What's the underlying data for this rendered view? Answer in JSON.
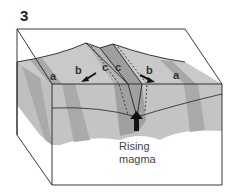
{
  "figure": {
    "number": "3",
    "labels": {
      "a_left": "a",
      "b_left": "b",
      "c_left": "c",
      "c_right": "c",
      "b_right": "b",
      "a_right": "a"
    },
    "caption_line1": "Rising",
    "caption_line2": "magma"
  },
  "colors": {
    "light_band": "#c8c8c8",
    "mid_band": "#b0b0b0",
    "dark_band": "#9c9c9c",
    "outline": "#222222",
    "background": "#ffffff"
  }
}
